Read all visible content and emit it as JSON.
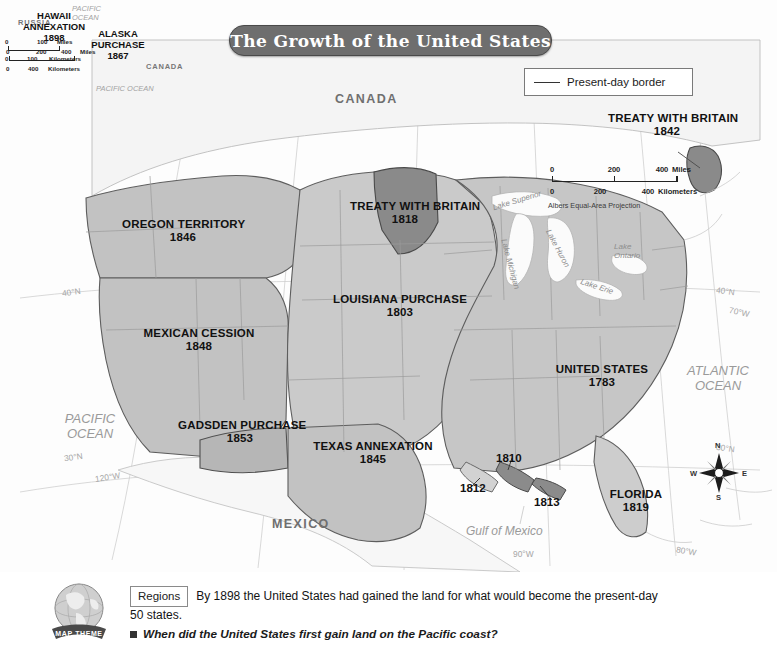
{
  "title": "The Growth of the United States",
  "legend": {
    "label": "Present-day border",
    "icon": "line-swatch"
  },
  "scale_main": {
    "miles": {
      "zero": "0",
      "mid": "200",
      "end": "400",
      "unit": "Miles"
    },
    "km": {
      "zero": "0",
      "mid": "200",
      "end": "400",
      "unit": "Kilometers"
    },
    "projection": "Albers Equal-Area Projection"
  },
  "territories": [
    {
      "name": "OREGON TERRITORY",
      "year": "1846"
    },
    {
      "name": "MEXICAN CESSION",
      "year": "1848"
    },
    {
      "name": "GADSDEN PURCHASE",
      "year": "1853"
    },
    {
      "name": "TEXAS ANNEXATION",
      "year": "1845"
    },
    {
      "name": "LOUISIANA PURCHASE",
      "year": "1803"
    },
    {
      "name": "TREATY WITH BRITAIN",
      "year": "1818"
    },
    {
      "name": "TREATY WITH BRITAIN",
      "year": "1842"
    },
    {
      "name": "UNITED STATES",
      "year": "1783"
    },
    {
      "name": "FLORIDA",
      "year": "1819"
    }
  ],
  "annotations": {
    "a1810": "1810",
    "a1812": "1812",
    "a1813": "1813"
  },
  "geography": {
    "canada": "CANADA",
    "mexico": "MEXICO",
    "pacific_ocean": "PACIFIC\nOCEAN",
    "pacific_line1": "PACIFIC",
    "pacific_line2": "OCEAN",
    "atlantic_line1": "ATLANTIC",
    "atlantic_line2": "OCEAN",
    "gulf": "Gulf of Mexico"
  },
  "lakes": {
    "superior": "Lake Superior",
    "michigan": "Lake Michigan",
    "huron": "Lake Huron",
    "erie": "Lake Erie",
    "ontario": "Lake\nOntario",
    "ontario_l1": "Lake",
    "ontario_l2": "Ontario"
  },
  "graticule": {
    "lat40_left": "40°N",
    "lat30_left": "30°N",
    "lat40_right": "40°N",
    "lat30_right": "30°N",
    "lon70": "70°W",
    "lon80": "80°W",
    "lon90": "90°W",
    "lon120": "120°W"
  },
  "compass": {
    "n": "N",
    "e": "E",
    "s": "S",
    "w": "W"
  },
  "inset_alaska": {
    "title_l1": "ALASKA",
    "title_l2": "PURCHASE",
    "year": "1867",
    "russia": "RUSSIA",
    "canada": "CANADA",
    "ocean": "PACIFIC OCEAN",
    "scale": {
      "miles": {
        "zero": "0",
        "mid": "200",
        "end": "400",
        "unit": "Miles"
      },
      "km": {
        "zero": "0",
        "end": "400",
        "unit": "Kilometers"
      }
    }
  },
  "inset_hawaii": {
    "title_l1": "HAWAII",
    "title_l2": "ANNEXATION",
    "year": "1898",
    "ocean_l1": "PACIFIC",
    "ocean_l2": "OCEAN",
    "scale": {
      "miles": {
        "zero": "0",
        "end": "100",
        "unit": "Miles"
      },
      "km": {
        "zero": "0",
        "end": "100",
        "unit": "Kilometers"
      }
    }
  },
  "caption": {
    "theme_tag": "Regions",
    "globe_banner": "MAP THEME",
    "body": "By 1898 the United States had gained the land for what would become the present-day 50 states.",
    "question": "When did the United States first gain land on the Pacific coast?"
  },
  "colors": {
    "banner": "#6e6e6e",
    "land_light": "#f3f3f3",
    "land_mid": "#c9c9c9",
    "land_dark": "#8d8d8d",
    "water": "#fdfdfd",
    "border": "#5a5a5a"
  }
}
